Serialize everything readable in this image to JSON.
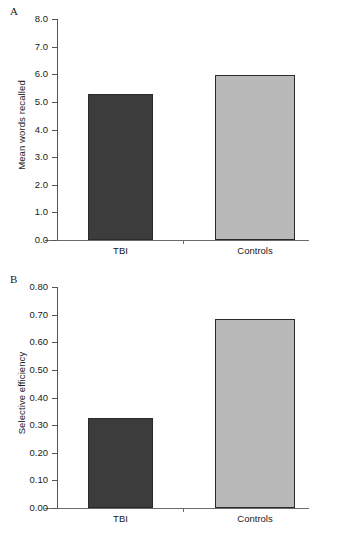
{
  "figure": {
    "panels": [
      {
        "letter": "A",
        "ylabel": "Mean words recalled",
        "yticks": [
          "0.0",
          "1.0",
          "2.0",
          "3.0",
          "4.0",
          "5.0",
          "6.0",
          "7.0",
          "8.0"
        ],
        "categories": [
          "TBI",
          "Controls"
        ],
        "values": [
          5.3,
          5.97
        ],
        "ymin": 0.0,
        "ymax": 8.0
      },
      {
        "letter": "B",
        "ylabel": "Selective efficiency",
        "yticks": [
          "0.00",
          "0.10",
          "0.20",
          "0.30",
          "0.40",
          "0.50",
          "0.60",
          "0.70",
          "0.80"
        ],
        "categories": [
          "TBI",
          "Controls"
        ],
        "values": [
          0.325,
          0.685
        ],
        "ymin": 0.0,
        "ymax": 0.8
      }
    ]
  },
  "chart_data": [
    {
      "type": "bar",
      "title": "A",
      "categories": [
        "TBI",
        "Controls"
      ],
      "values": [
        5.3,
        5.97
      ],
      "xlabel": "",
      "ylabel": "Mean words recalled",
      "ylim": [
        0.0,
        8.0
      ],
      "ytick_values": [
        0.0,
        1.0,
        2.0,
        3.0,
        4.0,
        5.0,
        6.0,
        7.0,
        8.0
      ],
      "ytick_labels": [
        "0.0",
        "1.0",
        "2.0",
        "3.0",
        "4.0",
        "5.0",
        "6.0",
        "7.0",
        "8.0"
      ],
      "grid": false,
      "legend": false,
      "bar_colors": [
        "#3c3c3c",
        "#b9b9b9"
      ]
    },
    {
      "type": "bar",
      "title": "B",
      "categories": [
        "TBI",
        "Controls"
      ],
      "values": [
        0.325,
        0.685
      ],
      "xlabel": "",
      "ylabel": "Selective efficiency",
      "ylim": [
        0.0,
        0.8
      ],
      "ytick_values": [
        0.0,
        0.1,
        0.2,
        0.3,
        0.4,
        0.5,
        0.6,
        0.7,
        0.8
      ],
      "ytick_labels": [
        "0.00",
        "0.10",
        "0.20",
        "0.30",
        "0.40",
        "0.50",
        "0.60",
        "0.70",
        "0.80"
      ],
      "grid": false,
      "legend": false,
      "bar_colors": [
        "#3c3c3c",
        "#b9b9b9"
      ]
    }
  ]
}
